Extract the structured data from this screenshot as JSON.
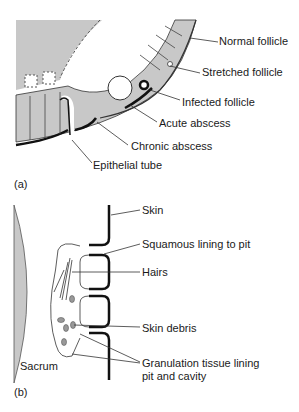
{
  "panel_a": {
    "tag": "(a)",
    "labels": {
      "normal_follicle": "Normal follicle",
      "stretched_follicle": "Stretched follicle",
      "infected_follicle": "Infected follicle",
      "acute_abscess": "Acute abscess",
      "chronic_abscess": "Chronic abscess",
      "epithelial_tube": "Epithelial tube"
    }
  },
  "panel_b": {
    "tag": "(b)",
    "labels": {
      "skin": "Skin",
      "squamous_lining": "Squamous lining to pit",
      "hairs": "Hairs",
      "skin_debris": "Skin debris",
      "granulation_line1": "Granulation tissue lining",
      "granulation_line2": "pit and cavity",
      "sacrum": "Sacrum"
    }
  },
  "colors": {
    "tissue_gray": "#c8c8c8",
    "line": "#1a1a1a"
  }
}
